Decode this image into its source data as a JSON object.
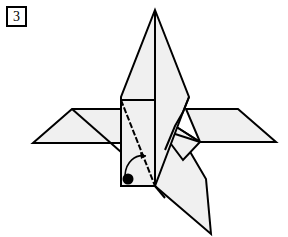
{
  "diagram": {
    "step_number": "3",
    "colors": {
      "paper": "#f0f0f0",
      "line": "#000000",
      "background": "#ffffff",
      "marker": "#000000"
    },
    "symbols": {
      "fold_line": "valley-fold-diagonal",
      "arrow": "curved-fold-arrow",
      "dot": "reference-point-dot"
    }
  }
}
